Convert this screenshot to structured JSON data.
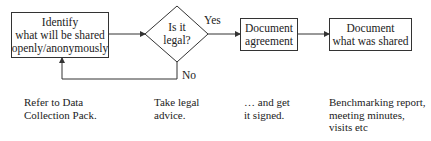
{
  "flowchart": {
    "nodes": [
      {
        "id": "identify",
        "shape": "rectangle",
        "lines": [
          "Identify",
          "what will be shared",
          "openly/anonymously"
        ]
      },
      {
        "id": "is-legal",
        "shape": "diamond",
        "lines": [
          "Is it",
          "legal?"
        ]
      },
      {
        "id": "document-agreement",
        "shape": "rectangle",
        "lines": [
          "Document",
          "agreement"
        ]
      },
      {
        "id": "document-shared",
        "shape": "rectangle",
        "lines": [
          "Document",
          "what was shared"
        ]
      }
    ],
    "edges": [
      {
        "from": "identify",
        "to": "is-legal",
        "label": ""
      },
      {
        "from": "is-legal",
        "to": "document-agreement",
        "label": "Yes"
      },
      {
        "from": "document-agreement",
        "to": "document-shared",
        "label": ""
      },
      {
        "from": "is-legal",
        "to": "identify",
        "label": "No"
      }
    ],
    "edge_labels": {
      "yes": "Yes",
      "no": "No"
    },
    "notes": [
      {
        "lines": [
          "Refer to Data",
          "Collection Pack."
        ]
      },
      {
        "lines": [
          "Take legal",
          "advice."
        ]
      },
      {
        "lines": [
          "… and get",
          "it signed."
        ]
      },
      {
        "lines": [
          "Benchmarking report,",
          "meeting minutes,",
          "visits etc"
        ]
      }
    ]
  },
  "colors": {
    "stroke": "#333333",
    "text": "#222222",
    "background": "#ffffff"
  }
}
